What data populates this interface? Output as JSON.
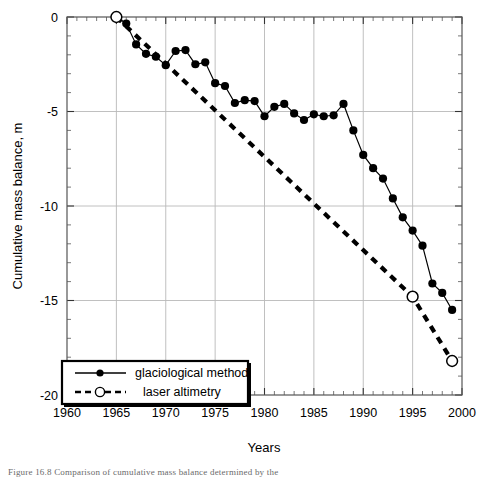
{
  "figure": {
    "caption": "Figure 16.8  Comparison of cumulative mass balance determined by the"
  },
  "chart_data": {
    "type": "line",
    "title": "",
    "xlabel": "Years",
    "ylabel": "Cumulative mass balance, m",
    "xlim": [
      1960,
      2000
    ],
    "ylim": [
      -20,
      0
    ],
    "xticks": [
      1960,
      1965,
      1970,
      1975,
      1980,
      1985,
      1990,
      1995,
      2000
    ],
    "yticks": [
      0,
      -5,
      -10,
      -15,
      -20
    ],
    "xtick_labels": [
      "1960",
      "1965",
      "1970",
      "1975",
      "1980",
      "1985",
      "1990",
      "1995",
      "2000"
    ],
    "ytick_labels": [
      "0",
      "-5",
      "-10",
      "-15",
      "-20"
    ],
    "grid": true,
    "minor_ticks": true,
    "legend_position": "bottom-left",
    "series": [
      {
        "name": "glaciological method",
        "style": "solid",
        "marker": "filled-circle",
        "color": "#000000",
        "x": [
          1965,
          1966,
          1967,
          1968,
          1969,
          1970,
          1971,
          1972,
          1973,
          1974,
          1975,
          1976,
          1977,
          1978,
          1979,
          1980,
          1981,
          1982,
          1983,
          1984,
          1985,
          1986,
          1987,
          1988,
          1989,
          1990,
          1991,
          1992,
          1993,
          1994,
          1995,
          1996,
          1997,
          1998,
          1999
        ],
        "y": [
          0.0,
          -0.35,
          -1.45,
          -1.95,
          -2.1,
          -2.55,
          -1.8,
          -1.75,
          -2.5,
          -2.4,
          -3.5,
          -3.65,
          -4.55,
          -4.4,
          -4.45,
          -5.25,
          -4.75,
          -4.6,
          -5.1,
          -5.45,
          -5.15,
          -5.25,
          -5.2,
          -4.6,
          -6.0,
          -7.3,
          -8.0,
          -8.55,
          -9.6,
          -10.6,
          -11.3,
          -12.1,
          -14.1,
          -14.6,
          -15.5
        ]
      },
      {
        "name": "laser altimetry",
        "style": "dashed",
        "marker": "open-circle",
        "color": "#000000",
        "x": [
          1965,
          1995,
          1999
        ],
        "y": [
          0.0,
          -14.8,
          -18.2
        ]
      }
    ]
  }
}
